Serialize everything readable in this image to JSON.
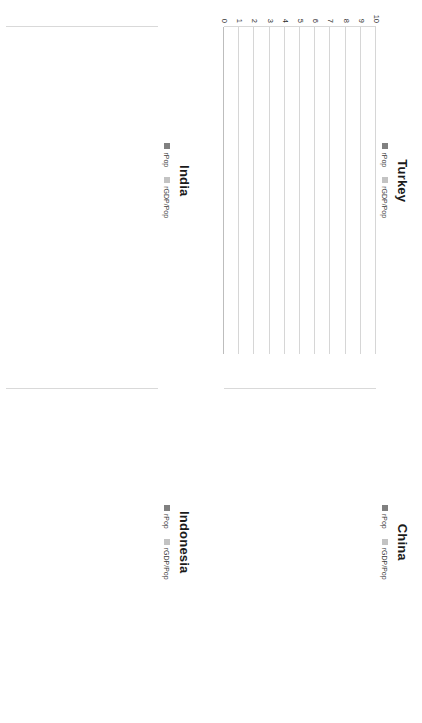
{
  "figure": {
    "legend": {
      "series": [
        {
          "name": "rPop",
          "label": "rPop",
          "color": "#808080"
        },
        {
          "name": "rGDPpop",
          "label": "rGDP/Pop",
          "color": "#c3c3c3"
        }
      ]
    },
    "axis": {
      "y_ticks": [
        "10",
        "9",
        "8",
        "7",
        "6",
        "5",
        "4",
        "3",
        "2",
        "1",
        "0"
      ],
      "y_min": 0,
      "y_max": 10,
      "x_categories": [
        "1970s",
        "1980s",
        "1990s",
        "2000s"
      ]
    },
    "colors": {
      "dark_series": "#808080",
      "light_series": "#c3c3c3",
      "gridline": "#d6d6d6",
      "text": "#2b2b2b",
      "title": "#1a1a1a",
      "background": "#ffffff"
    }
  },
  "panels": [
    {
      "id": "turkey",
      "title": "Turkey"
    },
    {
      "id": "china",
      "title": "China"
    },
    {
      "id": "india",
      "title": "India"
    },
    {
      "id": "indonesia",
      "title": "Indonesia"
    }
  ],
  "chart_data": [
    {
      "type": "bar",
      "stacked": true,
      "title": "Turkey",
      "xlabel": "",
      "ylabel": "",
      "ylim": [
        0,
        10
      ],
      "grid": true,
      "legend_position": "top-center",
      "categories": [
        "1970s",
        "1980s",
        "1990s",
        "2000s"
      ],
      "series": [
        {
          "name": "rPop",
          "values": [
            2.0,
            2.1,
            1.8,
            1.5
          ]
        },
        {
          "name": "rGDP/Pop",
          "values": [
            1.5,
            2.5,
            1.2,
            1.5
          ]
        }
      ],
      "totals": [
        3.5,
        4.6,
        3.0,
        3.0
      ]
    },
    {
      "type": "bar",
      "stacked": true,
      "title": "China",
      "xlabel": "",
      "ylabel": "",
      "ylim": [
        0,
        10
      ],
      "grid": true,
      "legend_position": "top-center",
      "categories": [
        "1970s",
        "1980s",
        "1990s",
        "2000s"
      ],
      "series": [
        {
          "name": "rPop",
          "values": [
            1.8,
            1.6,
            1.3,
            0.6
          ]
        },
        {
          "name": "rGDP/Pop",
          "values": [
            4.2,
            7.4,
            7.7,
            9.4
          ]
        }
      ],
      "totals": [
        6.0,
        9.0,
        9.0,
        10.0
      ]
    },
    {
      "type": "bar",
      "stacked": true,
      "title": "India",
      "xlabel": "",
      "ylabel": "",
      "ylim": [
        0,
        10
      ],
      "grid": true,
      "legend_position": "top-center",
      "categories": [
        "1970s",
        "1980s",
        "1990s",
        "2000s"
      ],
      "series": [
        {
          "name": "rPop",
          "values": [
            2.1,
            2.1,
            1.9,
            1.4
          ]
        },
        {
          "name": "rGDP/Pop",
          "values": [
            0.8,
            3.0,
            3.3,
            5.6
          ]
        }
      ],
      "totals": [
        2.9,
        5.1,
        5.2,
        7.0
      ]
    },
    {
      "type": "bar",
      "stacked": true,
      "title": "Indonesia",
      "xlabel": "",
      "ylabel": "",
      "ylim": [
        0,
        10
      ],
      "grid": true,
      "legend_position": "top-center",
      "categories": [
        "1970s",
        "1980s",
        "1990s",
        "2000s"
      ],
      "series": [
        {
          "name": "rPop",
          "values": [
            2.3,
            2.0,
            1.6,
            1.5
          ]
        },
        {
          "name": "rGDP/Pop",
          "values": [
            4.7,
            3.0,
            2.2,
            2.7
          ]
        }
      ],
      "totals": [
        7.0,
        5.0,
        3.8,
        4.2
      ]
    }
  ]
}
